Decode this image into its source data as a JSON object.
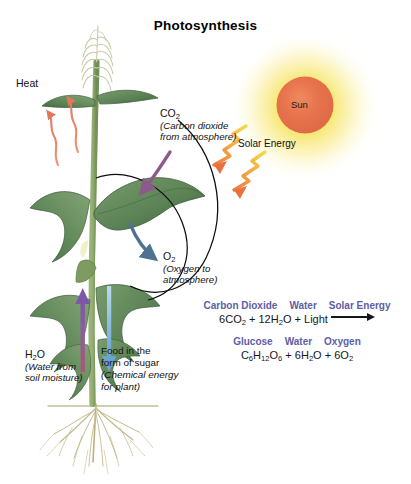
{
  "title": "Photosynthesis",
  "labels": {
    "heat": "Heat",
    "sun": "Sun",
    "solar_energy": "Solar Energy",
    "co2": "CO",
    "co2_sub": "2",
    "co2_desc_line1": "(Carbon dioxide",
    "co2_desc_line2": "from atmosphere)",
    "o2": "O",
    "o2_sub": "2",
    "o2_desc_line1": "(Oxygen to",
    "o2_desc_line2": "atmosphere)",
    "h2o": "H",
    "h2o_sub1": "2",
    "h2o_rest": "O",
    "h2o_desc_line1": "(Water from",
    "h2o_desc_line2": "soil moisture)",
    "food_line1": "Food in the",
    "food_line2": "form of sugar",
    "food_line3": "(Chemical energy",
    "food_line4": "for plant)"
  },
  "equation": {
    "reactant_headers": [
      "Carbon Dioxide",
      "Water",
      "Solar Energy"
    ],
    "reactants": [
      {
        "coef": "6",
        "formula": "CO",
        "sub": "2"
      },
      {
        "coef": "12",
        "formula": "H",
        "sub": "2",
        "tail": "O"
      },
      {
        "coef": "",
        "formula": "Light",
        "sub": ""
      }
    ],
    "reactant_text_parts": [
      "6CO",
      "2",
      " + 12H",
      "2",
      "O + Light"
    ],
    "product_headers": [
      "Glucose",
      "Water",
      "Oxygen"
    ],
    "product_text_parts": [
      "C",
      "6",
      "H",
      "12",
      "O",
      "6",
      " + 6H",
      "2",
      "O + 6O",
      "2"
    ],
    "arrow": "right-arrow"
  },
  "colors": {
    "equation_header": "#5b60a6",
    "sun_core": "#e8744e",
    "sun_glow": "#f5e14f",
    "heat_arrow": "#e8836a",
    "co2_arrow": "#8d5a8e",
    "o2_arrow": "#4d7391",
    "water_arrow": "#8d5d9e",
    "sugar_arrow": "#7fb2dd",
    "solar_arrow": "#f0a13c",
    "leaf_dark": "#4d7a4f",
    "leaf_mid": "#6f9566",
    "stem": "#8aa86a",
    "root": "#bfb887",
    "text": "#111111"
  }
}
